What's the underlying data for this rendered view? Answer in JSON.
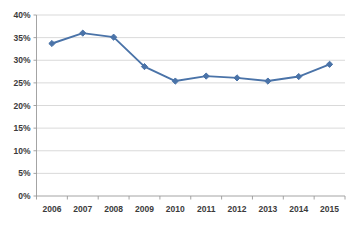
{
  "chart_data": {
    "type": "line",
    "title": "",
    "xlabel": "",
    "ylabel": "",
    "categories": [
      "2006",
      "2007",
      "2008",
      "2009",
      "2010",
      "2011",
      "2012",
      "2013",
      "2014",
      "2015"
    ],
    "values": [
      33.7,
      36.0,
      35.1,
      28.6,
      25.4,
      26.5,
      26.1,
      25.4,
      26.4,
      29.1
    ],
    "series": [
      {
        "name": "",
        "values": [
          33.7,
          36.0,
          35.1,
          28.6,
          25.4,
          26.5,
          26.1,
          25.4,
          26.4,
          29.1
        ],
        "color": "#4A73A8",
        "marker": "diamond"
      }
    ],
    "ylim": [
      0,
      40
    ],
    "ytick_values": [
      0,
      5,
      10,
      15,
      20,
      25,
      30,
      35,
      40
    ],
    "ytick_labels": [
      "0%",
      "5%",
      "10%",
      "15%",
      "20%",
      "25%",
      "30%",
      "35%",
      "40%"
    ],
    "xtick_labels": [
      "2006",
      "2007",
      "2008",
      "2009",
      "2010",
      "2011",
      "2012",
      "2013",
      "2014",
      "2015"
    ],
    "grid": "horizontal",
    "legend": "none",
    "value_format": "percent",
    "gridline_color": "#C9C9C9",
    "axis_color": "#9A9A9A",
    "background_color": "#FFFFFF",
    "series_color": "#4A73A8"
  }
}
